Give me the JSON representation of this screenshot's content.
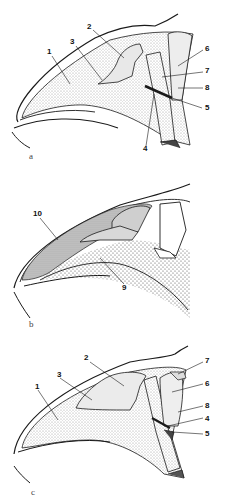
{
  "figure": {
    "panels": [
      {
        "id": "a",
        "letter": "a",
        "labels": [
          "1",
          "2",
          "3",
          "4",
          "5",
          "6",
          "7",
          "8"
        ]
      },
      {
        "id": "b",
        "letter": "b",
        "labels": [
          "10",
          "9"
        ]
      },
      {
        "id": "c",
        "letter": "c",
        "labels": [
          "1",
          "2",
          "3",
          "7",
          "6",
          "8",
          "4",
          "5"
        ]
      }
    ],
    "colors": {
      "ink": "#1a1a1a",
      "stipple": "#d8d8d8",
      "dense_stipple": "#9a9a9a",
      "background": "#ffffff"
    }
  }
}
